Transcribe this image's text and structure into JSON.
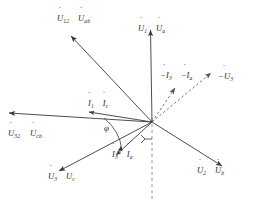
{
  "diagram": {
    "type": "phasor",
    "origin": {
      "x": 152,
      "y": 122
    },
    "stroke_color": "#3a3a3a",
    "dashed_color": "#6e6e6e",
    "background": "#ffffff",
    "angle_label": "φ"
  },
  "labels": {
    "u12_uab": {
      "sym": "U",
      "sub": "12",
      "sym2": "U",
      "sub2": "ab"
    },
    "u1_ua": {
      "sym": "U",
      "sub": "1",
      "sym2": "U",
      "sub2": "a"
    },
    "u32_ucb": {
      "sym": "U",
      "sub": "32",
      "sym2": "U",
      "sub2": "cb"
    },
    "u3_uc": {
      "sym": "U",
      "sub": "3",
      "sym2": "U",
      "sub2": "c"
    },
    "u2_ub": {
      "sym": "U",
      "sub": "2",
      "sym2": "U",
      "sub2": "b"
    },
    "i1_ic": {
      "sym": "I",
      "sub": "1",
      "sym2": "I",
      "sub2": "c"
    },
    "i3_ia": {
      "sym": "I",
      "sub": "3",
      "sym2": "I",
      "sub2": "a"
    },
    "neg_i3_ia": {
      "sym": "−I",
      "sub": "3",
      "sym2": "−I",
      "sub2": "a"
    },
    "neg_u3": {
      "sym": "−U",
      "sub": "3"
    }
  },
  "vectors": [
    {
      "name": "u1-ua",
      "angle_deg": 92,
      "length": 100,
      "style": "solid"
    },
    {
      "name": "u12-uab",
      "angle_deg": 133,
      "length": 118,
      "style": "solid"
    },
    {
      "name": "u32-ucb",
      "angle_deg": 180,
      "length": 146,
      "style": "solid"
    },
    {
      "name": "u3-uc",
      "angle_deg": 220,
      "length": 97,
      "style": "solid"
    },
    {
      "name": "u2-ub",
      "angle_deg": 329,
      "length": 82,
      "style": "solid"
    },
    {
      "name": "i1-ic",
      "angle_deg": 180,
      "length": 62,
      "style": "solid"
    },
    {
      "name": "i3-ia",
      "angle_deg": 243,
      "length": 46,
      "style": "solid"
    },
    {
      "name": "neg-i3-ia",
      "angle_deg": 58,
      "length": 40,
      "style": "dashed"
    },
    {
      "name": "neg-u3",
      "angle_deg": 40,
      "length": 76,
      "style": "dashed"
    },
    {
      "name": "vertical-axis",
      "angle_deg": 270,
      "length": 80,
      "style": "dashed"
    }
  ]
}
